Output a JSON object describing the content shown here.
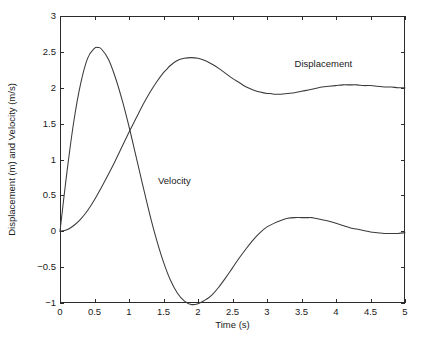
{
  "chart_data": {
    "type": "line",
    "title": "",
    "xlabel": "Time (s)",
    "ylabel": "Displacement (m) and Velocity (m/s)",
    "xlim": [
      0,
      5
    ],
    "ylim": [
      -1,
      3
    ],
    "xticks": [
      0,
      0.5,
      1,
      1.5,
      2,
      2.5,
      3,
      3.5,
      4,
      4.5,
      5
    ],
    "xticklabels": [
      "0",
      "0.5",
      "1",
      "1.5",
      "2",
      "2.5",
      "3",
      "3.5",
      "4",
      "4.5",
      "5"
    ],
    "yticks": [
      -1,
      -0.5,
      0,
      0.5,
      1,
      1.5,
      2,
      2.5,
      3
    ],
    "yticklabels": [
      "-1",
      "-0.5",
      "0",
      "0.5",
      "1",
      "1.5",
      "2",
      "2.5",
      "3"
    ],
    "grid": false,
    "legend_position": "inline-annotation",
    "box": true,
    "line_color": "#3a3a3a",
    "axis_color": "#2b2b2b",
    "background": "#ffffff",
    "model": {
      "description": "Underdamped second-order step response and its derivative",
      "steady_state": 2.0,
      "natural_frequency_rad_s": 2.12,
      "damping_ratio": 0.205
    },
    "annotations": [
      {
        "text": "Displacement",
        "x": 3.4,
        "y": 2.33
      },
      {
        "text": "Velocity",
        "x": 1.42,
        "y": 0.69
      }
    ],
    "series": [
      {
        "name": "Displacement",
        "units": "m",
        "x": [
          0,
          0.1,
          0.2,
          0.3,
          0.4,
          0.5,
          0.6,
          0.7,
          0.8,
          0.9,
          1,
          1.1,
          1.2,
          1.3,
          1.4,
          1.5,
          1.55,
          1.6,
          1.7,
          1.8,
          1.9,
          2,
          2.1,
          2.2,
          2.3,
          2.4,
          2.5,
          2.6,
          2.7,
          2.8,
          2.9,
          3,
          3.05,
          3.1,
          3.2,
          3.3,
          3.4,
          3.5,
          3.6,
          3.7,
          3.8,
          3.9,
          4,
          4.1,
          4.2,
          4.3,
          4.4,
          4.5,
          4.6,
          4.7,
          4.8,
          4.9,
          5
        ],
        "values": [
          0,
          0.02,
          0.08,
          0.17,
          0.29,
          0.44,
          0.61,
          0.79,
          0.98,
          1.18,
          1.38,
          1.57,
          1.76,
          1.93,
          2.08,
          2.21,
          2.26,
          2.31,
          2.38,
          2.41,
          2.42,
          2.41,
          2.38,
          2.33,
          2.27,
          2.2,
          2.13,
          2.07,
          2.01,
          1.97,
          1.94,
          1.92,
          1.92,
          1.91,
          1.91,
          1.92,
          1.93,
          1.95,
          1.97,
          1.99,
          2.01,
          2.02,
          2.03,
          2.04,
          2.04,
          2.04,
          2.03,
          2.03,
          2.02,
          2.01,
          2.01,
          2,
          2
        ],
        "markers": {
          "peak": {
            "x": 1.55,
            "y": 2.42
          },
          "trough": {
            "x": 3.05,
            "y": 1.92
          },
          "final": {
            "x": 5,
            "y": 2.0
          }
        }
      },
      {
        "name": "Velocity",
        "units": "m/s",
        "x": [
          0,
          0.1,
          0.2,
          0.3,
          0.4,
          0.5,
          0.55,
          0.6,
          0.7,
          0.8,
          0.9,
          1,
          1.1,
          1.2,
          1.3,
          1.4,
          1.5,
          1.6,
          1.7,
          1.8,
          1.9,
          2,
          2.1,
          2.15,
          2.2,
          2.3,
          2.4,
          2.5,
          2.6,
          2.7,
          2.8,
          2.9,
          3,
          3.1,
          3.2,
          3.3,
          3.4,
          3.5,
          3.6,
          3.65,
          3.7,
          3.8,
          3.9,
          4,
          4.1,
          4.2,
          4.3,
          4.4,
          4.5,
          4.6,
          4.7,
          4.8,
          4.9,
          5
        ],
        "values": [
          0,
          0.82,
          1.53,
          2.06,
          2.41,
          2.55,
          2.56,
          2.54,
          2.4,
          2.15,
          1.83,
          1.46,
          1.05,
          0.64,
          0.24,
          -0.12,
          -0.43,
          -0.68,
          -0.86,
          -0.97,
          -1.02,
          -1.01,
          -0.96,
          -0.93,
          -0.89,
          -0.78,
          -0.65,
          -0.51,
          -0.37,
          -0.24,
          -0.12,
          -0.02,
          0.06,
          0.11,
          0.15,
          0.18,
          0.19,
          0.19,
          0.19,
          0.19,
          0.18,
          0.16,
          0.14,
          0.11,
          0.08,
          0.05,
          0.03,
          0.01,
          -0.01,
          -0.02,
          -0.03,
          -0.03,
          -0.03,
          -0.02
        ],
        "markers": {
          "peak": {
            "x": 0.55,
            "y": 2.56
          },
          "trough": {
            "x": 2.15,
            "y": -0.54
          },
          "secondary_peak": {
            "x": 3.65,
            "y": 0.1
          },
          "final": {
            "x": 5,
            "y": -0.02
          }
        }
      }
    ]
  },
  "geometry": {
    "plot_left": 60,
    "plot_right": 405,
    "plot_top": 16,
    "plot_bottom": 303,
    "tick_length": 4,
    "xlabel_y": 328,
    "ylabel_x": 15
  }
}
